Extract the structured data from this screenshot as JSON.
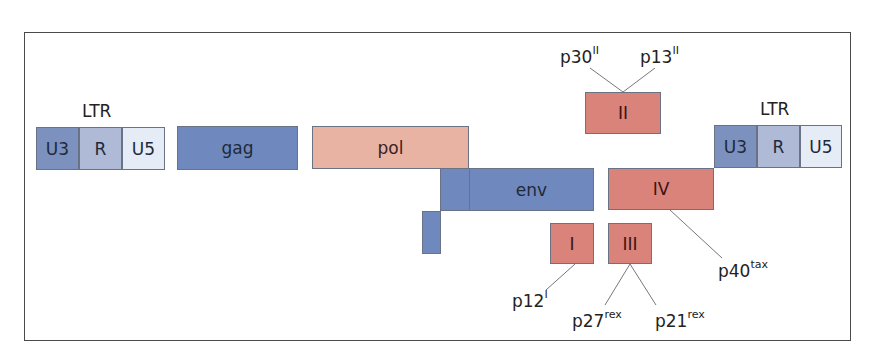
{
  "ltr_left": {
    "title": "LTR",
    "segments": [
      "U3",
      "R",
      "U5"
    ]
  },
  "ltr_right": {
    "title": "LTR",
    "segments": [
      "U3",
      "R",
      "U5"
    ]
  },
  "genes": {
    "gag": "gag",
    "pol": "pol",
    "env": "env",
    "II": "II",
    "IV": "IV",
    "I": "I",
    "III": "III"
  },
  "proteins": {
    "p30": {
      "base": "p30",
      "sup": "II"
    },
    "p13": {
      "base": "p13",
      "sup": "II"
    },
    "p40": {
      "base": "p40",
      "sup": "tax"
    },
    "p12": {
      "base": "p12",
      "sup": "I"
    },
    "p27": {
      "base": "p27",
      "sup": "rex"
    },
    "p21": {
      "base": "p21",
      "sup": "rex"
    }
  },
  "colors": {
    "structural_blue": "#6f88bd",
    "pol_pink": "#e8b3a2",
    "accessory_red": "#d9837a",
    "u3": "#7d91bf",
    "r": "#aebad6",
    "u5": "#e6ecf6"
  }
}
